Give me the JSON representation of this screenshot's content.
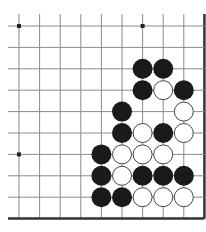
{
  "board": {
    "title": "Go problem diagram (lower-right corner)",
    "columns": 10,
    "rows": 10,
    "origin_x": 19,
    "origin_y": 26,
    "spacing_x": 20.6,
    "spacing_y": 21.4,
    "line_color": "#8a8a8a",
    "edge_color": "#333333",
    "background": "#ffffff",
    "stone_radius": 10,
    "edges": [
      "right",
      "bottom"
    ],
    "star_points": [
      [
        0,
        0
      ],
      [
        6,
        0
      ],
      [
        0,
        6
      ]
    ],
    "black_stones": [
      [
        6,
        2
      ],
      [
        7,
        2
      ],
      [
        6,
        3
      ],
      [
        8,
        3
      ],
      [
        5,
        4
      ],
      [
        5,
        5
      ],
      [
        7,
        5
      ],
      [
        4,
        6
      ],
      [
        4,
        7
      ],
      [
        6,
        7
      ],
      [
        7,
        7
      ],
      [
        8,
        7
      ],
      [
        4,
        8
      ],
      [
        5,
        8
      ]
    ],
    "white_stones": [
      [
        7,
        3
      ],
      [
        8,
        4
      ],
      [
        6,
        5
      ],
      [
        8,
        5
      ],
      [
        5,
        6
      ],
      [
        6,
        6
      ],
      [
        7,
        6
      ],
      [
        5,
        7
      ],
      [
        6,
        8
      ],
      [
        7,
        8
      ],
      [
        8,
        8
      ]
    ],
    "colors": {
      "black_stone": "#1a1a1a",
      "white_stone": "#ffffff",
      "white_stone_outline": "#444444"
    }
  }
}
